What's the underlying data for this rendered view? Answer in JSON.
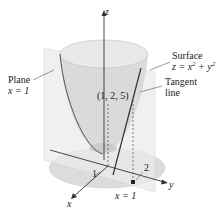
{
  "diagram": {
    "axes": {
      "z_label": "z",
      "x_label": "x",
      "y_label": "y",
      "x_tick": "1",
      "y_tick": "2"
    },
    "labels": {
      "plane_line1": "Plane",
      "plane_line2": "x = 1",
      "surface_line1": "Surface",
      "surface_line2_prefix": "z = x",
      "surface_line2_mid": " + y",
      "surface_exp": "2",
      "tangent_line1": "Tangent",
      "tangent_line2": "line",
      "point": "(1, 2, 5)",
      "base_label": "x = 1"
    },
    "colors": {
      "surface_fill": "#d9dadb",
      "surface_top": "#e6e7e8",
      "plane_fill": "#ececec",
      "disk_fill": "#dcdcdc",
      "line": "#333333"
    }
  }
}
